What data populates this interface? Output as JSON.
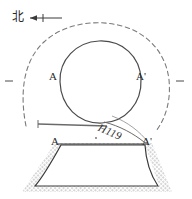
{
  "figure": {
    "type": "archaeological-plan-and-section",
    "orientation": {
      "label": "北",
      "meaning": "north",
      "arrow": "left"
    },
    "labels": {
      "plan_left": "A",
      "plan_right": "A'",
      "section_left": "A",
      "section_right": "A'",
      "feature_id": "H119"
    },
    "colors": {
      "ink": "#3a3a3a",
      "ink_light": "#6b6b6b",
      "hatch": "#b8b8b8",
      "background": "#ffffff"
    },
    "elements": {
      "inner_circle": "solid pit outline",
      "outer_arc": "dashed surrounding arc",
      "section_line": "A - A' cut line",
      "section_profile": "trapezoidal pit cross-section with stippled fill"
    }
  }
}
